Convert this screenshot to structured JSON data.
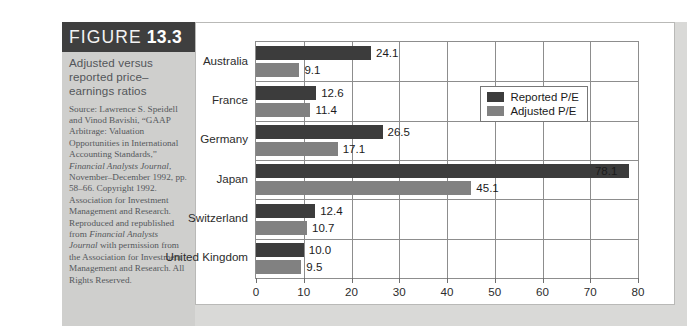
{
  "figure": {
    "label_word": "FIGURE",
    "label_number": "13.3",
    "title": "Adjusted versus reported price–earnings ratios",
    "source": "Source: Lawrence S. Speidell and Vinod Bavishi, “GAAP Arbitrage: Valuation Opportunities in International Accounting Standards,” ",
    "source_italic_1": "Financial Analysts Journal",
    "source_mid": ", November–December 1992, pp. 58–66. Copyright 1992. Association for Investment Management and Research. Reproduced and republished from ",
    "source_italic_2": "Financial Analysts Journal",
    "source_end": " with permission from the Association for Investment Management and Research. All Rights Reserved."
  },
  "chart_data": {
    "type": "bar",
    "orientation": "horizontal",
    "title": "",
    "xlabel": "",
    "ylabel": "",
    "xlim": [
      0,
      80
    ],
    "xticks": [
      0,
      10,
      20,
      30,
      40,
      50,
      60,
      70,
      80
    ],
    "tick_labels": [
      "0",
      "10",
      "20",
      "30",
      "40",
      "50",
      "60",
      "70",
      "80"
    ],
    "grid": true,
    "legend_position": "upper-right-inside",
    "categories": [
      "Australia",
      "France",
      "Germany",
      "Japan",
      "Switzerland",
      "United Kingdom"
    ],
    "series": [
      {
        "name": "Reported P/E",
        "color": "#3c3c3c",
        "values": [
          24.1,
          12.6,
          26.5,
          78.1,
          12.4,
          10.0
        ],
        "labels": [
          "24.1",
          "12.6",
          "26.5",
          "78.1",
          "12.4",
          "10.0"
        ]
      },
      {
        "name": "Adjusted P/E",
        "color": "#818181",
        "values": [
          9.1,
          11.4,
          17.1,
          45.1,
          10.7,
          9.5
        ],
        "labels": [
          "9.1",
          "11.4",
          "17.1",
          "45.1",
          "10.7",
          "9.5"
        ]
      }
    ]
  }
}
